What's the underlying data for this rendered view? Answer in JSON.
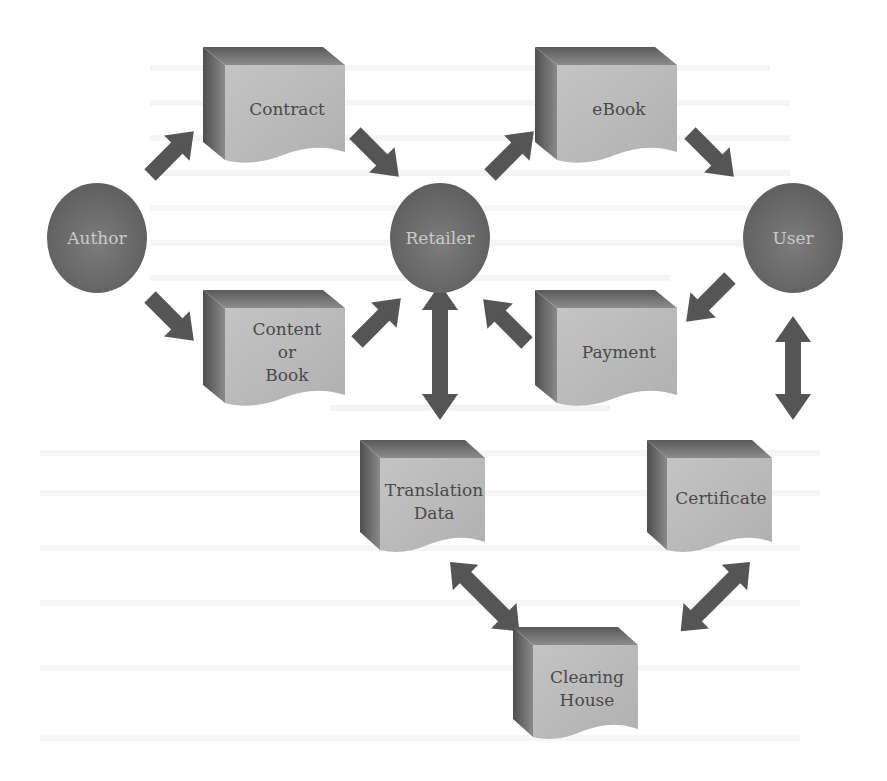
{
  "diagram": {
    "colors": {
      "background": "#ffffff",
      "circle_fill": "#6a6a6a",
      "circle_label": "#c9c9c9",
      "box_front": "#b9b9b9",
      "box_side": "#5a5a5a",
      "box_top": "#707070",
      "box_label": "#4a4a4a",
      "arrow": "#555555"
    },
    "nodes": {
      "author": {
        "label": "Author",
        "shape": "circle"
      },
      "retailer": {
        "label": "Retailer",
        "shape": "circle"
      },
      "user": {
        "label": "User",
        "shape": "circle"
      },
      "contract": {
        "label": "Contract",
        "shape": "document-box"
      },
      "content": {
        "lines": [
          "Content",
          "or",
          "Book"
        ],
        "shape": "document-box"
      },
      "ebook": {
        "label": "eBook",
        "shape": "document-box"
      },
      "payment": {
        "label": "Payment",
        "shape": "document-box"
      },
      "translation": {
        "lines": [
          "Translation",
          "Data"
        ],
        "shape": "document-box"
      },
      "certificate": {
        "label": "Certificate",
        "shape": "document-box"
      },
      "clearing": {
        "lines": [
          "Clearing",
          "House"
        ],
        "shape": "document-box"
      }
    },
    "edges": [
      {
        "from": "Author",
        "to": "Contract",
        "direction": "one-way"
      },
      {
        "from": "Author",
        "to": "Content or Book",
        "direction": "one-way"
      },
      {
        "from": "Contract",
        "to": "Retailer",
        "direction": "one-way"
      },
      {
        "from": "Content or Book",
        "to": "Retailer",
        "direction": "one-way"
      },
      {
        "from": "Retailer",
        "to": "eBook",
        "direction": "one-way"
      },
      {
        "from": "eBook",
        "to": "User",
        "direction": "one-way"
      },
      {
        "from": "User",
        "to": "Payment",
        "direction": "one-way"
      },
      {
        "from": "Payment",
        "to": "Retailer",
        "direction": "one-way"
      },
      {
        "from": "Retailer",
        "to": "Translation Data",
        "direction": "two-way"
      },
      {
        "from": "User",
        "to": "Certificate",
        "direction": "two-way"
      },
      {
        "from": "Translation Data",
        "to": "Clearing House",
        "direction": "two-way"
      },
      {
        "from": "Certificate",
        "to": "Clearing House",
        "direction": "two-way"
      }
    ]
  }
}
